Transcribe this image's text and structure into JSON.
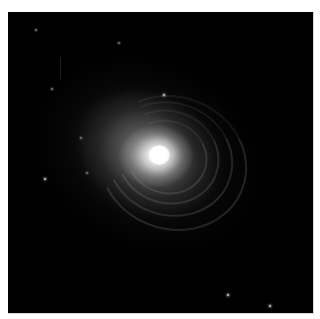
{
  "image": {
    "subject": "galaxy",
    "description": "Elliptical/shell galaxy with bright core and faint concentric shells on a black background",
    "background_color": "#000000",
    "frame_color": "#ffffff",
    "core_color": "#ffffff",
    "halo_color": "#8a8a8a"
  },
  "galaxy": {
    "core_center": [
      159,
      155
    ],
    "shells": [
      {
        "left": 118,
        "top": 108,
        "width": 78,
        "height": 70
      },
      {
        "left": 108,
        "top": 98,
        "width": 100,
        "height": 90
      },
      {
        "left": 98,
        "top": 90,
        "width": 124,
        "height": 110
      },
      {
        "left": 90,
        "top": 84,
        "width": 146,
        "height": 130
      }
    ]
  },
  "stars": [
    {
      "x": 155,
      "y": 82,
      "bright": true
    },
    {
      "x": 36,
      "y": 166,
      "bright": true
    },
    {
      "x": 72,
      "y": 125,
      "bright": false
    },
    {
      "x": 43,
      "y": 76,
      "bright": false
    },
    {
      "x": 78,
      "y": 160,
      "bright": false
    },
    {
      "x": 219,
      "y": 282,
      "bright": true
    },
    {
      "x": 261,
      "y": 293,
      "bright": true
    },
    {
      "x": 27,
      "y": 17,
      "bright": false
    },
    {
      "x": 110,
      "y": 30,
      "bright": false
    }
  ]
}
